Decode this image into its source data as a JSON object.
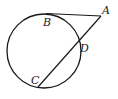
{
  "diagram": {
    "type": "circle-tangent-secant",
    "stroke_color": "#1a1a1a",
    "background": "#ffffff",
    "circle": {
      "cx": 44,
      "cy": 51,
      "r": 37
    },
    "points": {
      "A": {
        "label": "A",
        "x": 101,
        "y": 16
      },
      "B": {
        "label": "B",
        "x": 46,
        "y": 14
      },
      "C": {
        "label": "C",
        "x": 38,
        "y": 87
      },
      "D": {
        "label": "D",
        "x": 79,
        "y": 42
      }
    },
    "segments": [
      {
        "name": "tangent-AB",
        "from": "A",
        "to": "B"
      },
      {
        "name": "secant-AC",
        "from": "A",
        "to": "C"
      }
    ],
    "labels": {
      "A": "A",
      "B": "B",
      "C": "C",
      "D": "D"
    }
  }
}
